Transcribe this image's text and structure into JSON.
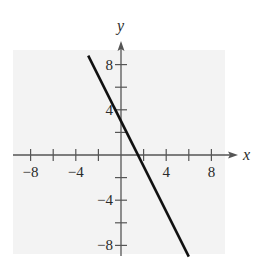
{
  "chart_data": {
    "type": "line",
    "title": "",
    "xlabel": "x",
    "ylabel": "y",
    "xlim": [
      -9.5,
      10.5
    ],
    "ylim": [
      -9,
      10
    ],
    "grid": false,
    "x_ticks": [
      -8,
      -6,
      -4,
      -2,
      2,
      4,
      6,
      8
    ],
    "y_ticks": [
      -8,
      -6,
      -4,
      -2,
      2,
      4,
      6,
      8
    ],
    "x_tick_labels": [
      {
        "value": -8,
        "label": "−8"
      },
      {
        "value": -4,
        "label": "−4"
      },
      {
        "value": 4,
        "label": "4"
      },
      {
        "value": 8,
        "label": "8"
      }
    ],
    "y_tick_labels": [
      {
        "value": 8,
        "label": "8"
      },
      {
        "value": 4,
        "label": "4"
      },
      {
        "value": -4,
        "label": "−4"
      },
      {
        "value": -8,
        "label": "−8"
      }
    ],
    "series": [
      {
        "name": "y = -2x + 3",
        "equation": "y = -2x + 3",
        "slope": -2,
        "intercept": 3,
        "x": [
          -2.9,
          6.0
        ],
        "y": [
          8.8,
          -9.0
        ],
        "color": "#111111"
      }
    ],
    "background_color": "#f3f3f3"
  }
}
